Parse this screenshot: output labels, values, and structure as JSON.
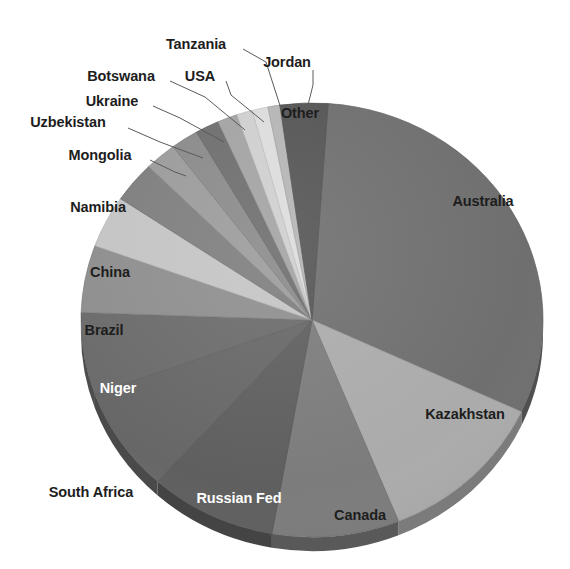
{
  "chart_data": {
    "type": "pie",
    "title": "",
    "subtitle": "",
    "xlabel": "",
    "ylabel": "",
    "legend_position": "none",
    "grid": false,
    "style": "3d-grayscale-exploded-none",
    "categories": [
      "Australia",
      "Kazakhstan",
      "Canada",
      "Russian Fed",
      "South Africa",
      "Niger",
      "Brazil",
      "China",
      "Namibia",
      "Mongolia",
      "Uzbekistan",
      "Ukraine",
      "Botswana",
      "USA",
      "Tanzania",
      "Jordan",
      "Other"
    ],
    "values": [
      31.0,
      12.0,
      9.0,
      9.0,
      8.0,
      6.0,
      5.0,
      4.0,
      3.0,
      2.2,
      2.0,
      1.6,
      1.3,
      1.2,
      1.1,
      0.8,
      9.0
    ],
    "units": "percent",
    "slices": [
      {
        "label": "Australia",
        "value": 31.0,
        "start_angle": 4,
        "end_angle": 115,
        "color": "#6f6f6f",
        "label_color": "#1d1d1d",
        "label_placement": "inside"
      },
      {
        "label": "Kazakhstan",
        "value": 12.0,
        "start_angle": 115,
        "end_angle": 158,
        "color": "#ababab",
        "label_color": "#1d1d1d",
        "label_placement": "inside"
      },
      {
        "label": "Canada",
        "value": 9.0,
        "start_angle": 158,
        "end_angle": 190,
        "color": "#7c7c7c",
        "label_color": "#1d1d1d",
        "label_placement": "inside"
      },
      {
        "label": "Russian Fed",
        "value": 9.0,
        "start_angle": 190,
        "end_angle": 222,
        "color": "#5f5f5f",
        "label_color": "#ffffff",
        "label_placement": "inside"
      },
      {
        "label": "South Africa",
        "value": 8.0,
        "start_angle": 222,
        "end_angle": 250,
        "color": "#676767",
        "label_color": "#1d1d1d",
        "label_placement": "outside"
      },
      {
        "label": "Niger",
        "value": 6.0,
        "start_angle": 250,
        "end_angle": 272,
        "color": "#6b6b6b",
        "label_color": "#ffffff",
        "label_placement": "inside"
      },
      {
        "label": "Brazil",
        "value": 5.0,
        "start_angle": 272,
        "end_angle": 290,
        "color": "#8e8e8e",
        "label_color": "#1d1d1d",
        "label_placement": "inside"
      },
      {
        "label": "China",
        "value": 4.0,
        "start_angle": 290,
        "end_angle": 304,
        "color": "#c4c4c4",
        "label_color": "#1d1d1d",
        "label_placement": "inside"
      },
      {
        "label": "Namibia",
        "value": 3.0,
        "start_angle": 304,
        "end_angle": 315,
        "color": "#7e7e7e",
        "label_color": "#1d1d1d",
        "label_placement": "inside"
      },
      {
        "label": "Mongolia",
        "value": 2.2,
        "start_angle": 315,
        "end_angle": 323,
        "color": "#9b9b9b",
        "label_color": "#1d1d1d",
        "label_placement": "outside"
      },
      {
        "label": "Uzbekistan",
        "value": 2.0,
        "start_angle": 323,
        "end_angle": 330,
        "color": "#8a8a8a",
        "label_color": "#1d1d1d",
        "label_placement": "outside"
      },
      {
        "label": "Ukraine",
        "value": 1.6,
        "start_angle": 330,
        "end_angle": 336,
        "color": "#6e6e6e",
        "label_color": "#1d1d1d",
        "label_placement": "outside"
      },
      {
        "label": "Botswana",
        "value": 1.3,
        "start_angle": 336,
        "end_angle": 341,
        "color": "#a3a3a3",
        "label_color": "#1d1d1d",
        "label_placement": "outside"
      },
      {
        "label": "USA",
        "value": 1.2,
        "start_angle": 341,
        "end_angle": 345,
        "color": "#cfcfcf",
        "label_color": "#1d1d1d",
        "label_placement": "outside"
      },
      {
        "label": "Tanzania",
        "value": 1.1,
        "start_angle": 345,
        "end_angle": 349,
        "color": "#dcdcdc",
        "label_color": "#1d1d1d",
        "label_placement": "outside"
      },
      {
        "label": "Jordan",
        "value": 0.8,
        "start_angle": 349,
        "end_angle": 352,
        "color": "#b5b5b5",
        "label_color": "#1d1d1d",
        "label_placement": "outside"
      },
      {
        "label": "Other",
        "value": 9.0,
        "start_angle": 352,
        "end_angle": 364,
        "color": "#555555",
        "label_color": "#1d1d1d",
        "label_placement": "inside"
      }
    ],
    "geometry": {
      "center_x": 312,
      "center_y": 320,
      "radius_x": 231,
      "radius_y": 217,
      "depth": 14
    },
    "labels_outside": [
      {
        "label": "Tanzania",
        "text_x": 196,
        "text_y": 44,
        "leader": [
          [
            243,
            49
          ],
          [
            266,
            62
          ],
          [
            284,
            118
          ]
        ]
      },
      {
        "label": "Jordan",
        "text_x": 287,
        "text_y": 62,
        "leader": [
          [
            313,
            70
          ],
          [
            313,
            85
          ],
          [
            306,
            113
          ]
        ]
      },
      {
        "label": "Botswana",
        "text_x": 121,
        "text_y": 76,
        "leader": [
          [
            170,
            81
          ],
          [
            205,
            97
          ],
          [
            245,
            130
          ]
        ]
      },
      {
        "label": "USA",
        "text_x": 200,
        "text_y": 76,
        "leader": [
          [
            226,
            81
          ],
          [
            231,
            95
          ],
          [
            264,
            122
          ]
        ]
      },
      {
        "label": "Ukraine",
        "text_x": 112,
        "text_y": 101,
        "leader": [
          [
            153,
            106
          ],
          [
            180,
            118
          ],
          [
            224,
            142
          ]
        ]
      },
      {
        "label": "Uzbekistan",
        "text_x": 68,
        "text_y": 122,
        "leader": [
          [
            128,
            128
          ],
          [
            160,
            142
          ],
          [
            203,
            158
          ]
        ]
      },
      {
        "label": "Mongolia",
        "text_x": 100,
        "text_y": 155,
        "leader": [
          [
            150,
            160
          ],
          [
            175,
            172
          ],
          [
            186,
            176
          ]
        ]
      },
      {
        "label": "Namibia",
        "text_x": 98,
        "text_y": 207,
        "leader": null
      },
      {
        "label": "China",
        "text_x": 110,
        "text_y": 272,
        "leader": null
      },
      {
        "label": "Brazil",
        "text_x": 104,
        "text_y": 330,
        "leader": null
      },
      {
        "label": "Niger",
        "text_x": 118,
        "text_y": 388,
        "leader": null
      },
      {
        "label": "South Africa",
        "text_x": 91,
        "text_y": 492,
        "leader": null
      },
      {
        "label": "Russian Fed",
        "text_x": 239,
        "text_y": 498,
        "leader": null
      },
      {
        "label": "Canada",
        "text_x": 360,
        "text_y": 515,
        "leader": null
      },
      {
        "label": "Kazakhstan",
        "text_x": 465,
        "text_y": 414,
        "leader": null
      },
      {
        "label": "Australia",
        "text_x": 483,
        "text_y": 201,
        "leader": null
      },
      {
        "label": "Other",
        "text_x": 300,
        "text_y": 113,
        "leader": null
      }
    ]
  }
}
